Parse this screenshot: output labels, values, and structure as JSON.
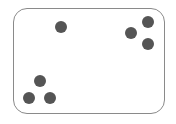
{
  "frame": {
    "stroke": "#8a8a8a",
    "fill": "#ffffff"
  },
  "dot_color": "#555555",
  "dots": [
    {
      "cx": 61,
      "cy": 27,
      "r": 6
    },
    {
      "cx": 131,
      "cy": 33,
      "r": 6
    },
    {
      "cx": 148,
      "cy": 22,
      "r": 6
    },
    {
      "cx": 148,
      "cy": 44,
      "r": 6
    },
    {
      "cx": 40,
      "cy": 81,
      "r": 6
    },
    {
      "cx": 29,
      "cy": 98,
      "r": 6
    },
    {
      "cx": 50,
      "cy": 98,
      "r": 6
    }
  ]
}
